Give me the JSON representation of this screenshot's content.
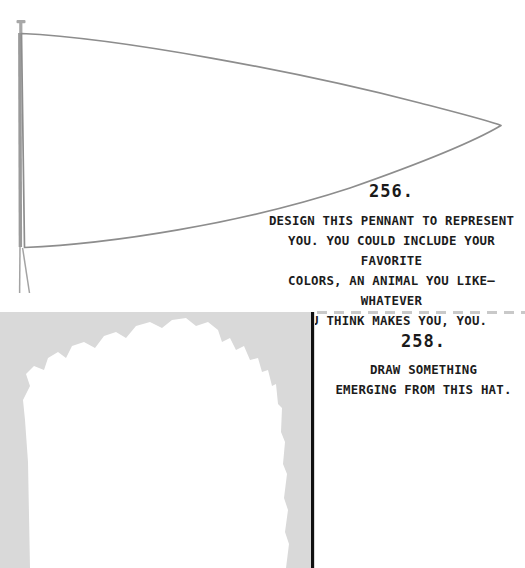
{
  "page": {
    "background_color": "#ffffff",
    "width": 525,
    "height": 568
  },
  "prompts": [
    {
      "id": "256",
      "number_label": "256.",
      "body_text": "DESIGN THIS PENNANT TO REPRESENT\nYOU. YOU COULD INCLUDE YOUR FAVORITE\nCOLORS, AN ANIMAL YOU LIKE—WHATEVER\nYOU THINK MAKES YOU, YOU.",
      "text_color": "#1c1c1c"
    },
    {
      "id": "258",
      "number_label": "258.",
      "body_text": "DRAW SOMETHING\nEMERGING FROM THIS HAT.",
      "text_color": "#1c1c1c"
    }
  ],
  "artwork": {
    "pennant": {
      "name": "pennant-flag-outline",
      "stroke_color": "#8d8d8d",
      "pole_color": "#9a9a9a",
      "fill_color": "#ffffff"
    },
    "hat": {
      "name": "hat-silhouette-block",
      "block_color": "#d9d9d9",
      "inner_shape_color": "#ffffff"
    }
  },
  "dividers": {
    "dashed": {
      "name": "dashed-divider",
      "color": "#c9c9c9",
      "dash_length": 10,
      "gap_length": 7
    },
    "vertical_rule": {
      "name": "vertical-black-rule",
      "color": "#111111",
      "width": 3
    }
  }
}
